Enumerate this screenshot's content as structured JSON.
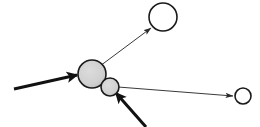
{
  "canvas": {
    "width": 260,
    "height": 127,
    "background": "#ffffff",
    "title": "node-link diagram"
  },
  "style": {
    "node_fill_filled": "#cfcfcf",
    "node_fill_empty": "#ffffff",
    "node_stroke": "#1a1a1a",
    "node_stroke_width": 1.6,
    "edge_thin_color": "#3a3a3a",
    "edge_thin_width": 1.0,
    "edge_thick_color": "#111111",
    "edge_thick_width": 3.0
  },
  "nodes": [
    {
      "id": "n1",
      "name": "large-filled-node",
      "cx": 92,
      "cy": 74,
      "r": 14,
      "fill": "filled",
      "label": ""
    },
    {
      "id": "n2",
      "name": "small-filled-node",
      "cx": 110,
      "cy": 87,
      "r": 9,
      "fill": "filled",
      "label": ""
    },
    {
      "id": "n3",
      "name": "top-empty-node",
      "cx": 163,
      "cy": 17,
      "r": 14,
      "fill": "empty",
      "label": ""
    },
    {
      "id": "n4",
      "name": "right-empty-node",
      "cx": 243,
      "cy": 96,
      "r": 8,
      "fill": "empty",
      "label": ""
    }
  ],
  "edges": [
    {
      "id": "e1",
      "name": "incoming-edge-left",
      "x1": 14,
      "y1": 89,
      "x2": 77,
      "y2": 75,
      "weight": "thick",
      "arrow": "end",
      "label": ""
    },
    {
      "id": "e2",
      "name": "incoming-edge-bottom",
      "x1": 146,
      "y1": 127,
      "x2": 116,
      "y2": 93,
      "weight": "thick",
      "arrow": "end",
      "label": ""
    },
    {
      "id": "e3",
      "name": "outgoing-edge-top",
      "x1": 100,
      "y1": 66,
      "x2": 151,
      "y2": 28,
      "weight": "thin",
      "arrow": "end",
      "label": ""
    },
    {
      "id": "e4",
      "name": "outgoing-edge-right",
      "x1": 118,
      "y1": 87,
      "x2": 233,
      "y2": 96,
      "weight": "thin",
      "arrow": "end",
      "label": ""
    }
  ]
}
